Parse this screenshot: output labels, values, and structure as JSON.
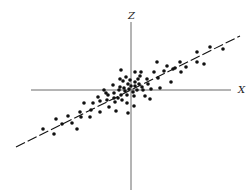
{
  "chart_data": {
    "type": "scatter",
    "title": "",
    "xlabel": "X",
    "zlabel": "Z",
    "projection": "3d-oblique",
    "grid": false,
    "legend": null,
    "axes": {
      "x_axis": {
        "x1": 31,
        "y1": 90,
        "x2": 231,
        "y2": 90,
        "label": "X",
        "label_pos": [
          238,
          93
        ]
      },
      "z_axis": {
        "x1": 131,
        "y1": 22,
        "x2": 131,
        "y2": 190,
        "label": "Z",
        "label_pos": [
          128,
          19
        ]
      }
    },
    "fit_line": {
      "style": "dashed",
      "x1": 16,
      "y1": 147,
      "x2": 240,
      "y2": 36
    },
    "points": [
      [
        43,
        129
      ],
      [
        54,
        134
      ],
      [
        56,
        119
      ],
      [
        62,
        124
      ],
      [
        68,
        116
      ],
      [
        72,
        123
      ],
      [
        77,
        129
      ],
      [
        80,
        112
      ],
      [
        81,
        117
      ],
      [
        84,
        103
      ],
      [
        90,
        117
      ],
      [
        91,
        110
      ],
      [
        93,
        103
      ],
      [
        98,
        97
      ],
      [
        100,
        112
      ],
      [
        100,
        101
      ],
      [
        104,
        90
      ],
      [
        106,
        93
      ],
      [
        107,
        100
      ],
      [
        108,
        95
      ],
      [
        109,
        107
      ],
      [
        113,
        85
      ],
      [
        114,
        93
      ],
      [
        114,
        98
      ],
      [
        115,
        102
      ],
      [
        116,
        111
      ],
      [
        118,
        98
      ],
      [
        119,
        90
      ],
      [
        120,
        79
      ],
      [
        120,
        87
      ],
      [
        121,
        70
      ],
      [
        121,
        95
      ],
      [
        122,
        100
      ],
      [
        123,
        81
      ],
      [
        124,
        88
      ],
      [
        125,
        91
      ],
      [
        126,
        77
      ],
      [
        127,
        95
      ],
      [
        127,
        103
      ],
      [
        128,
        113
      ],
      [
        128,
        84
      ],
      [
        129,
        89
      ],
      [
        130,
        80
      ],
      [
        131,
        86
      ],
      [
        133,
        92
      ],
      [
        134,
        96
      ],
      [
        134,
        106
      ],
      [
        135,
        72
      ],
      [
        135,
        82
      ],
      [
        135,
        86
      ],
      [
        137,
        90
      ],
      [
        138,
        79
      ],
      [
        139,
        84
      ],
      [
        140,
        76
      ],
      [
        141,
        72
      ],
      [
        142,
        87
      ],
      [
        143,
        90
      ],
      [
        145,
        96
      ],
      [
        147,
        79
      ],
      [
        148,
        84
      ],
      [
        150,
        99
      ],
      [
        151,
        89
      ],
      [
        154,
        72
      ],
      [
        157,
        62
      ],
      [
        158,
        78
      ],
      [
        160,
        88
      ],
      [
        164,
        71
      ],
      [
        167,
        66
      ],
      [
        171,
        82
      ],
      [
        173,
        69
      ],
      [
        175,
        68
      ],
      [
        180,
        62
      ],
      [
        181,
        72
      ],
      [
        186,
        67
      ],
      [
        197,
        52
      ],
      [
        197,
        62
      ],
      [
        204,
        64
      ],
      [
        210,
        47
      ],
      [
        223,
        49
      ]
    ],
    "dot_radius": 1.8,
    "colors": {
      "dots": "#111111",
      "axes": "#444444",
      "fit_line": "#111111",
      "background": "#ffffff"
    }
  }
}
